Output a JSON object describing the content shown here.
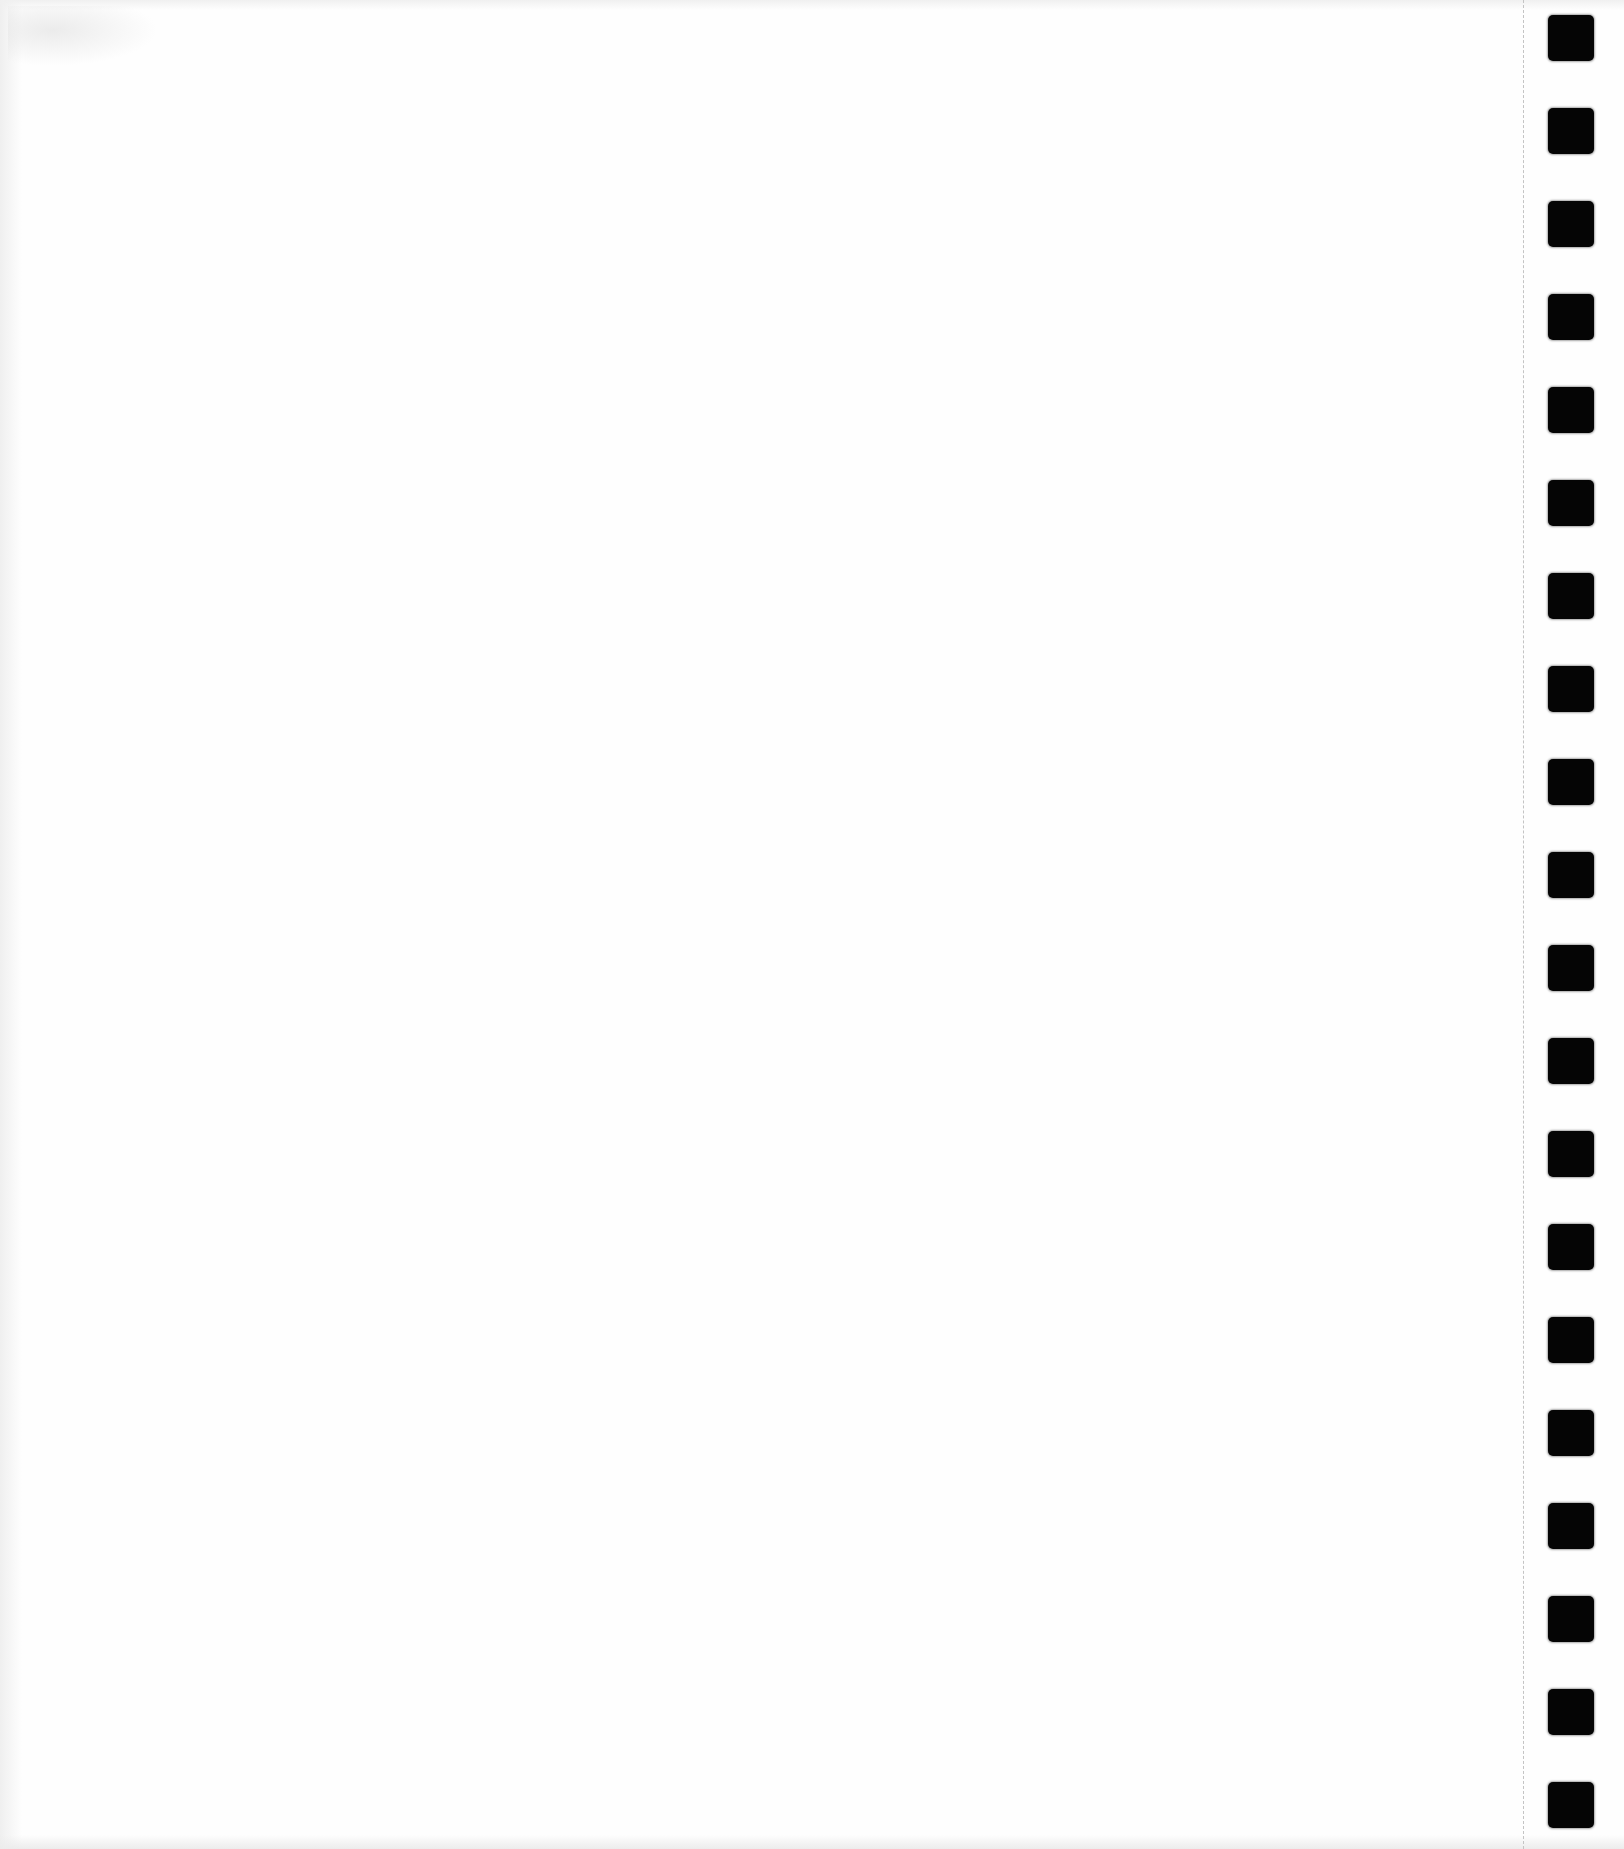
{
  "page": {
    "type": "blank-scanned-sheet",
    "background_color": "#fefefe",
    "text_content": ""
  },
  "perforation": {
    "style": "dashed",
    "x": 1523,
    "color": "#c4c4c4"
  },
  "registration_marks": {
    "count": 20,
    "color": "#050505",
    "x": 1548,
    "size": 46,
    "first_top": 15,
    "pitch": 93
  }
}
